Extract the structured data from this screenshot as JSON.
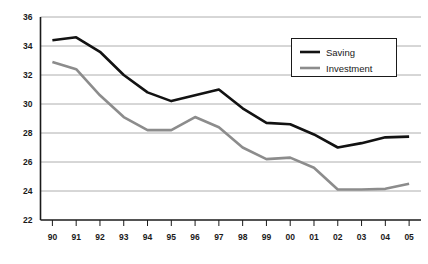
{
  "chart_data": {
    "type": "line",
    "title": "",
    "xlabel": "",
    "ylabel": "",
    "categories": [
      "90",
      "91",
      "92",
      "93",
      "94",
      "95",
      "96",
      "97",
      "98",
      "99",
      "00",
      "01",
      "02",
      "03",
      "04",
      "05"
    ],
    "ylim": [
      22,
      36
    ],
    "ytick_step": 2,
    "yticks": [
      22,
      24,
      26,
      28,
      30,
      32,
      34,
      36
    ],
    "grid": true,
    "legend_position": "top-right",
    "series": [
      {
        "name": "Saving",
        "color": "#121212",
        "line_width": 2.6,
        "values": [
          34.4,
          34.6,
          33.6,
          32.0,
          30.8,
          30.2,
          30.6,
          31.0,
          29.7,
          28.7,
          28.6,
          27.9,
          27.0,
          27.3,
          27.7,
          27.75
        ]
      },
      {
        "name": "Investment",
        "color": "#8c8c8c",
        "line_width": 2.6,
        "values": [
          32.9,
          32.4,
          30.6,
          29.1,
          28.2,
          28.2,
          29.1,
          28.4,
          27.0,
          26.2,
          26.3,
          25.6,
          24.1,
          24.1,
          24.15,
          24.5
        ]
      }
    ]
  },
  "legend": {
    "items": [
      {
        "label": "Saving"
      },
      {
        "label": "Investment"
      }
    ]
  }
}
